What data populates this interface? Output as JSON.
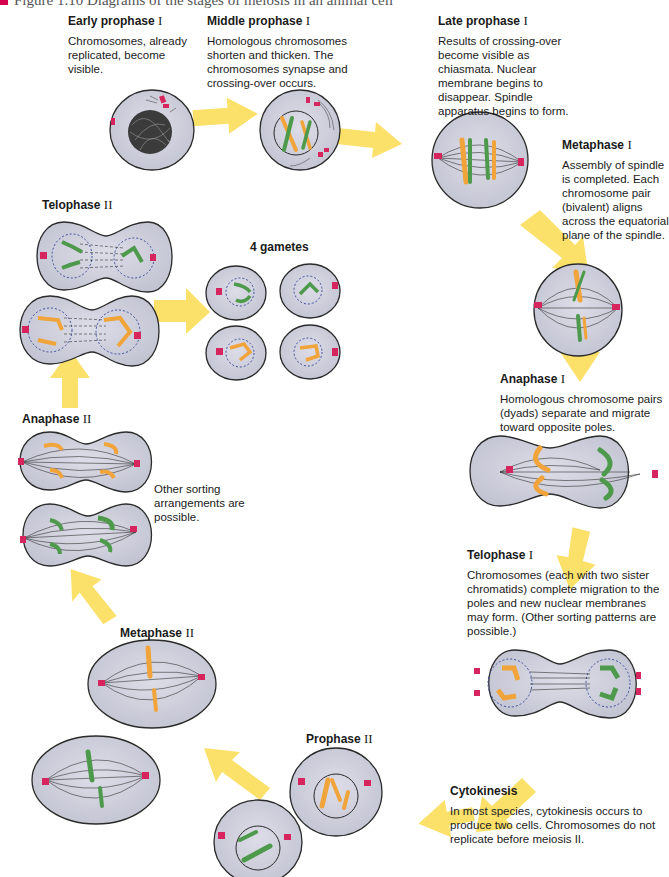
{
  "figure": {
    "caption": "Figure 1.10  Diagrams of the stages of meiosis in an animal cell"
  },
  "stages": [
    {
      "id": "early-prophase-1",
      "title": "Early prophase",
      "numeral": "I",
      "description": "Chromosomes, already replicated, become visible."
    },
    {
      "id": "middle-prophase-1",
      "title": "Middle prophase",
      "numeral": "I",
      "description": "Homologous chromosomes shorten and thicken. The chromosomes synapse and crossing-over occurs."
    },
    {
      "id": "late-prophase-1",
      "title": "Late prophase",
      "numeral": "I",
      "description": "Results of crossing-over become visible as chiasmata. Nuclear membrane begins to disappear. Spindle apparatus begins to form."
    },
    {
      "id": "metaphase-1",
      "title": "Metaphase",
      "numeral": "I",
      "description": "Assembly of spindle is completed. Each chromosome pair (bivalent) aligns across the equatorial plane of the spindle."
    },
    {
      "id": "anaphase-1",
      "title": "Anaphase",
      "numeral": "I",
      "description": "Homologous chromosome pairs (dyads) separate and migrate toward opposite poles."
    },
    {
      "id": "telophase-1",
      "title": "Telophase",
      "numeral": "I",
      "description": "Chromosomes (each with two sister chromatids) complete migration to the poles and new nuclear membranes may form. (Other sorting patterns are possible.)"
    },
    {
      "id": "cytokinesis",
      "title": "Cytokinesis",
      "numeral": "",
      "description": "In most species, cytokinesis occurs to produce two cells. Chromosomes do not replicate before meiosis II."
    },
    {
      "id": "prophase-2",
      "title": "Prophase",
      "numeral": "II",
      "description": ""
    },
    {
      "id": "metaphase-2",
      "title": "Metaphase",
      "numeral": "II",
      "description": ""
    },
    {
      "id": "anaphase-2",
      "title": "Anaphase",
      "numeral": "II",
      "description": "Other sorting arrangements are possible."
    },
    {
      "id": "telophase-2",
      "title": "Telophase",
      "numeral": "II",
      "description": ""
    },
    {
      "id": "gametes",
      "title": "4 gametes",
      "numeral": "",
      "description": ""
    }
  ],
  "colors": {
    "cell_fill": "#cfd0dc",
    "cell_stroke": "#2a2a2a",
    "arrow": "#fbe16a",
    "chromosome_orange": "#f0a43a",
    "chromosome_green": "#4e9a4c",
    "centriole": "#d6245e",
    "spindle": "#333333",
    "nuclear_dotted": "#3a4fa0"
  }
}
